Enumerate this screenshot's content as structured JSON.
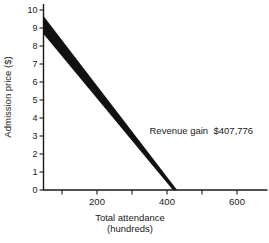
{
  "figure": {
    "background": "#ffffff",
    "ink": "#1a1a1a"
  },
  "chart_data": {
    "type": "area",
    "title": "",
    "ylabel": "Admission price ($)",
    "xlabel_lines": [
      "Total attendance",
      "(hundreds)"
    ],
    "xlim": [
      0,
      690
    ],
    "ylim": [
      0,
      10
    ],
    "grid": false,
    "legend": null,
    "x_ticks": [
      100,
      200,
      300,
      400,
      500,
      600
    ],
    "x_labeled_ticks": [
      200,
      400,
      600
    ],
    "y_ticks": [
      0,
      1,
      2,
      3,
      4,
      5,
      6,
      7,
      8,
      9,
      10
    ],
    "series": [
      {
        "name": "upper-price-line",
        "points": [
          [
            46,
            9.7
          ],
          [
            429,
            0
          ]
        ]
      },
      {
        "name": "lower-price-line",
        "points": [
          [
            46,
            8.7
          ],
          [
            417,
            0
          ]
        ]
      }
    ],
    "band_fill": "#111111",
    "annotation": {
      "label": "Revenue gain",
      "value": "$407,776",
      "x": 350,
      "y": 3.3
    }
  }
}
